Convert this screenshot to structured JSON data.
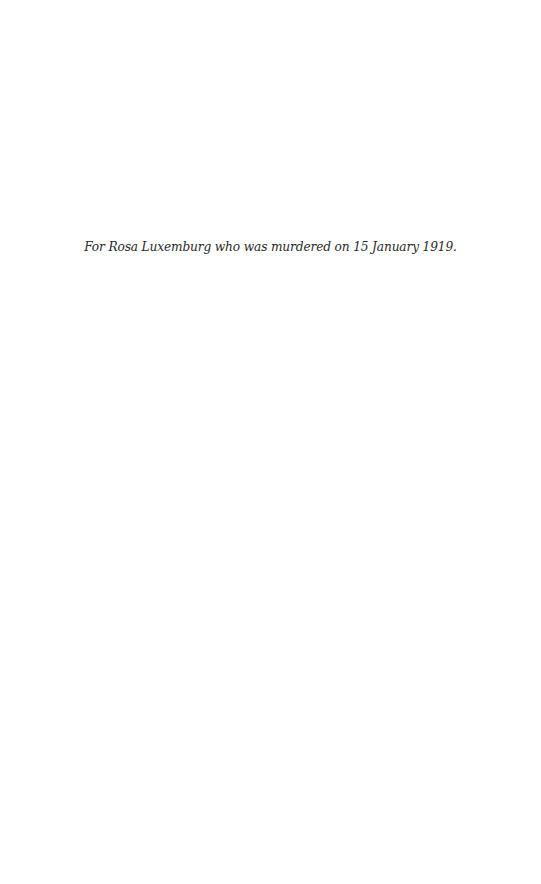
{
  "page": {
    "dedication": "For Rosa Luxemburg who was murdered on 15 January 1919."
  }
}
